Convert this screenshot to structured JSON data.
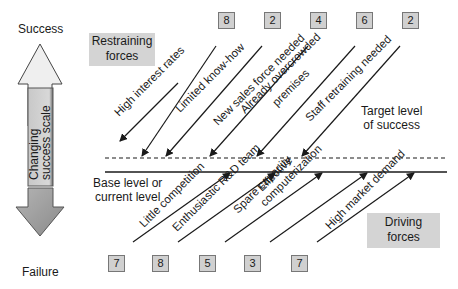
{
  "scale": {
    "top_label": "Success",
    "bottom_label": "Failure",
    "bar_label_line1": "Changing",
    "bar_label_line2": "success scale"
  },
  "restraining": {
    "title_line1": "Restraining",
    "title_line2": "forces",
    "forces": [
      {
        "label": "High interest rates",
        "score": "8"
      },
      {
        "label": "Limited know-how",
        "score": "2"
      },
      {
        "label": "New sales force needed",
        "score": "4"
      },
      {
        "label": "Already overcrowded premises",
        "line1": "Already overcrowded",
        "line2": "premises",
        "score": "6"
      },
      {
        "label": "Staff retraining needed",
        "score": "2"
      }
    ],
    "scores": [
      "8",
      "2",
      "4",
      "6",
      "2"
    ]
  },
  "driving": {
    "title_line1": "Driving",
    "title_line2": "forces",
    "forces": [
      {
        "label": "Little competition",
        "score": "7"
      },
      {
        "label": "Enthusiastic R&D team",
        "score": "8"
      },
      {
        "label": "Spare capacity",
        "score": "5"
      },
      {
        "label": "Effective computerization",
        "line1": "Effective",
        "line2": "computerization",
        "score": "3"
      },
      {
        "label": "High market demand",
        "score": "7"
      }
    ],
    "scores": [
      "7",
      "8",
      "5",
      "3",
      "7"
    ]
  },
  "levels": {
    "base_line1": "Base level or",
    "base_line2": "current level",
    "target_line1": "Target level",
    "target_line2": "of success"
  },
  "colors": {
    "box_fill": "#d4d4d4",
    "arrow_fill": "#e0e0e0",
    "line": "#1a1a1a"
  }
}
